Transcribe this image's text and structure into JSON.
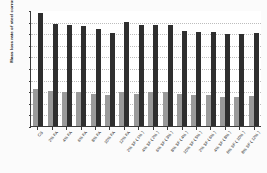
{
  "chart_data": {
    "type": "bar",
    "title": "",
    "xlabel": "",
    "ylabel": "Mass loss rate of steel corrosion ( % )",
    "ylim": [
      0,
      0.1
    ],
    "ytick_labels": [
      "0.1",
      "0.09",
      "0.08",
      "0.07",
      "0.06",
      "0.05",
      "0.04",
      "0.03",
      "0.02",
      "0.01",
      "0"
    ],
    "ytick_values": [
      0.1,
      0.09,
      0.08,
      0.07,
      0.06,
      0.05,
      0.04,
      0.03,
      0.02,
      0.01,
      0
    ],
    "grid": true,
    "legend": "none",
    "categories": [
      "CS",
      "2% FA",
      "4% FA",
      "6% FA",
      "8% FA",
      "10% FA",
      "12% FA",
      "2% SF ( 1% )",
      "4% SF ( 2% )",
      "6% SF ( 3% )",
      "8% SF ( 4% )",
      "10% SF ( 5% )",
      "2% SF ( 6% )",
      "4% SF ( 8% )",
      "6% SF ( 10% )",
      "8% SF ( 12% )"
    ],
    "series": [
      {
        "name": "Light gray bars",
        "color": "#9a9a9a",
        "values": [
          0.032,
          0.03,
          0.029,
          0.029,
          0.028,
          0.027,
          0.029,
          0.028,
          0.029,
          0.029,
          0.028,
          0.027,
          0.027,
          0.025,
          0.025,
          0.026
        ]
      },
      {
        "name": "Dark bars",
        "color": "#2f2f2f",
        "values": [
          0.097,
          0.088,
          0.087,
          0.086,
          0.084,
          0.08,
          0.09,
          0.087,
          0.087,
          0.087,
          0.082,
          0.081,
          0.081,
          0.079,
          0.079,
          0.08
        ]
      }
    ]
  }
}
